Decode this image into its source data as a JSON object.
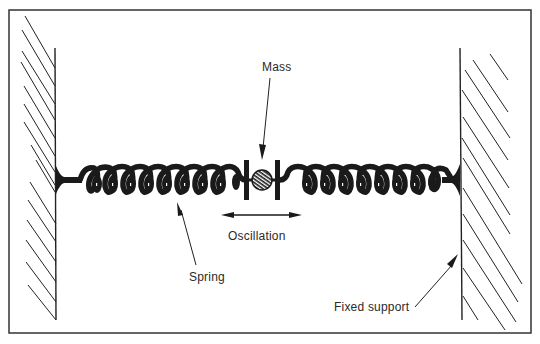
{
  "diagram": {
    "labels": {
      "mass": "Mass",
      "oscillation": "Oscillation",
      "spring": "Spring",
      "fixed_support": "Fixed support"
    },
    "components": [
      {
        "id": "left-fixed-support",
        "type": "wall"
      },
      {
        "id": "left-spring",
        "type": "spring",
        "coils": 9
      },
      {
        "id": "mass",
        "type": "mass"
      },
      {
        "id": "right-spring",
        "type": "spring",
        "coils": 9
      },
      {
        "id": "right-fixed-support",
        "type": "wall"
      }
    ],
    "colors": {
      "ink": "#1a1a1a",
      "background": "#ffffff"
    }
  }
}
